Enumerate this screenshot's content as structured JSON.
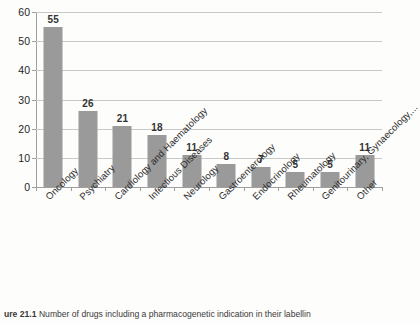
{
  "chart_data": {
    "type": "bar",
    "title": "",
    "xlabel": "",
    "ylabel": "",
    "ylim": [
      0,
      60
    ],
    "ytick_step": 10,
    "yticks": [
      0,
      10,
      20,
      30,
      40,
      50,
      60
    ],
    "grid": "horizontal",
    "legend": "none",
    "bar_color": "#9a9a9a",
    "categories": [
      "Oncology",
      "Psychiatry",
      "Cardiology and Haematology",
      "Infectious Diseases",
      "Neurology",
      "Gastroenterology",
      "Endocrinology",
      "Rheumatology",
      "Genitourinary, Gynaecology,...",
      "Other"
    ],
    "values": [
      55,
      26,
      21,
      18,
      11,
      8,
      7,
      5,
      5,
      11
    ],
    "data_labels": [
      "55",
      "26",
      "21",
      "18",
      "11",
      "8",
      "7",
      "5",
      "5",
      "11"
    ]
  },
  "caption": {
    "figure_number": "ure 21.1",
    "text": "Number of drugs including a pharmacogenetic indication in their labellin"
  }
}
